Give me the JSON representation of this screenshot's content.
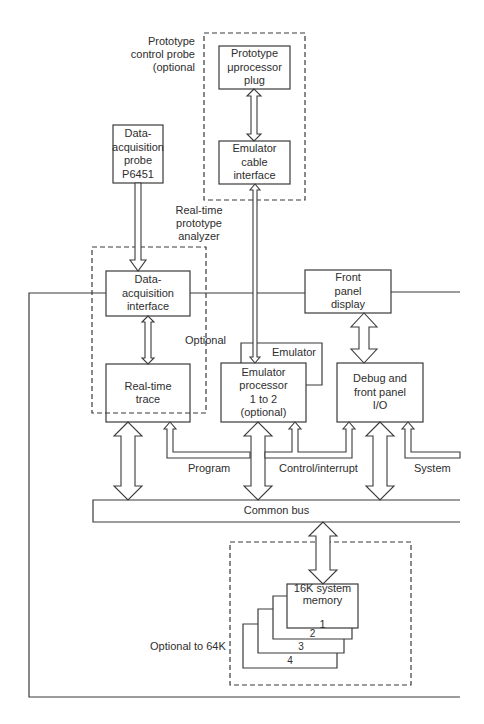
{
  "diagram": {
    "colors": {
      "line": "#3a3a3a",
      "background": "#ffffff",
      "text": "#2e2e2e"
    },
    "labels": {
      "prototype_control_probe": "Prototype\ncontrol probe\n(optional",
      "real_time_analyzer": "Real-time\nprototype\nanalyzer",
      "optional": "Optional",
      "emulator": "Emulator",
      "program": "Program",
      "control_interrupt": "Control/interrupt",
      "system": "System",
      "optional_to_64k": "Optional to 64K"
    },
    "boxes": {
      "prototype_uprocessor_plug": "Prototype\nμprocessor\nplug",
      "emulator_cable_interface": "Emulator\ncable\ninterface",
      "data_acquisition_probe": "Data-\nacquisition\nprobe\nP6451",
      "data_acquisition_interface": "Data-\nacquisition\ninterface",
      "front_panel_display": "Front\npanel\ndisplay",
      "real_time_trace": "Real-time\ntrace",
      "emulator_processor": "Emulator\nprocessor\n1 to 2\n(optional)",
      "debug_front_panel_io": "Debug and\nfront panel\nI/O",
      "common_bus": "Common bus",
      "memory_1": "16K system\nmemory\n\n1",
      "memory_2": "2",
      "memory_3": "3",
      "memory_4": "4"
    }
  }
}
